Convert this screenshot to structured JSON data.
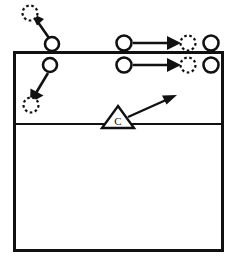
{
  "diagram": {
    "kind": "volleyball-court-drill",
    "title": "",
    "court": {
      "left": 13,
      "top": 51,
      "right": 223,
      "bottom": 252,
      "line_color": "#111111",
      "fill_color": "#ffffff",
      "attack_line_y": 124
    },
    "legend_note": "",
    "markers": [
      {
        "id": "player-out-left-start",
        "type": "player-solid",
        "label": "",
        "cx": 52,
        "cy": 44,
        "r": 7
      },
      {
        "id": "player-out-left-target",
        "type": "player-dashed",
        "label": "",
        "cx": 30,
        "cy": 13,
        "r": 7
      },
      {
        "id": "player-in-left-start",
        "type": "player-solid",
        "label": "",
        "cx": 50,
        "cy": 65,
        "r": 7
      },
      {
        "id": "player-in-left-target",
        "type": "player-dashed",
        "label": "",
        "cx": 31,
        "cy": 105,
        "r": 7
      },
      {
        "id": "player-out-right-start",
        "type": "player-solid",
        "label": "",
        "cx": 124,
        "cy": 43,
        "r": 7
      },
      {
        "id": "player-out-right-target",
        "type": "player-dashed",
        "label": "",
        "cx": 188,
        "cy": 43,
        "r": 7
      },
      {
        "id": "player-out-right-extra",
        "type": "player-solid",
        "label": "",
        "cx": 211,
        "cy": 43,
        "r": 7
      },
      {
        "id": "player-in-right-start",
        "type": "player-solid",
        "label": "",
        "cx": 124,
        "cy": 65,
        "r": 7
      },
      {
        "id": "player-in-right-target",
        "type": "player-dashed",
        "label": "",
        "cx": 188,
        "cy": 65,
        "r": 7
      },
      {
        "id": "player-in-right-extra",
        "type": "player-solid",
        "label": "",
        "cx": 211,
        "cy": 65,
        "r": 7
      }
    ],
    "coach": {
      "id": "coach-marker",
      "label": "C",
      "cx": 118,
      "cy": 120,
      "half_width": 16,
      "height": 18
    },
    "movement_arrows": [
      {
        "id": "arrow-out-left-up",
        "from": {
          "x": 49,
          "y": 38
        },
        "to": {
          "x": 35,
          "y": 18
        },
        "style": "solid-thick"
      },
      {
        "id": "arrow-in-left-down",
        "from": {
          "x": 48,
          "y": 73
        },
        "to": {
          "x": 33,
          "y": 99
        },
        "style": "solid-thick"
      },
      {
        "id": "arrow-out-right",
        "from": {
          "x": 133,
          "y": 43
        },
        "to": {
          "x": 180,
          "y": 43
        },
        "style": "solid-thick"
      },
      {
        "id": "arrow-in-right",
        "from": {
          "x": 133,
          "y": 65
        },
        "to": {
          "x": 180,
          "y": 65
        },
        "style": "solid-thick"
      }
    ],
    "ball_arrows": [
      {
        "id": "arrow-coach-toss",
        "from": {
          "x": 130,
          "y": 116
        },
        "to": {
          "x": 175,
          "y": 97
        },
        "style": "solid"
      }
    ]
  }
}
